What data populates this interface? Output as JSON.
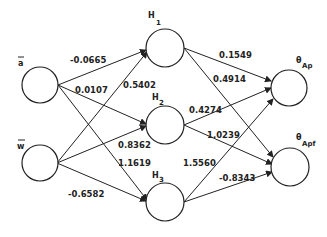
{
  "diagram": {
    "type": "neural-network",
    "layers": {
      "input": [
        {
          "id": "a",
          "label": "a",
          "overbar": true
        },
        {
          "id": "w",
          "label": "w",
          "overbar": true
        }
      ],
      "hidden": [
        {
          "id": "H1",
          "label": "H",
          "sub": "1"
        },
        {
          "id": "H2",
          "label": "H",
          "sub": "2"
        },
        {
          "id": "H3",
          "label": "H",
          "sub": "3"
        }
      ],
      "output": [
        {
          "id": "thetaAp",
          "label": "θ",
          "sub": "Ap"
        },
        {
          "id": "thetaApf",
          "label": "θ",
          "sub": "Apf"
        }
      ]
    },
    "weights": {
      "a_H1": "-0.0665",
      "a_H2": "0.0107",
      "a_H3": "1.1619",
      "w_H1": "0.5402",
      "w_H2": "0.8362",
      "w_H3": "-0.6582",
      "H1_Ap": "0.1549",
      "H1_Apf": "0.4914",
      "H2_Ap": "0.4274",
      "H2_Apf": "1.0239",
      "H3_Ap": "1.5560",
      "H3_Apf": "-0.8343"
    }
  }
}
